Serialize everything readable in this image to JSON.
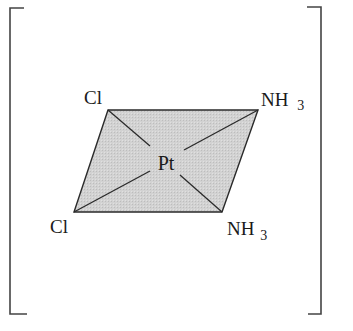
{
  "diagram": {
    "central_atom": "Pt",
    "ligands": [
      {
        "position": "top-left",
        "label": "Cl"
      },
      {
        "position": "top-right",
        "label": "NH",
        "subscript": "3"
      },
      {
        "position": "bottom-left",
        "label": "Cl"
      },
      {
        "position": "bottom-right",
        "label": "NH",
        "subscript": "3"
      }
    ],
    "enclosure": "square-brackets",
    "colors": {
      "plane_fill": "#cfcfcf",
      "line": "#2a2a2a",
      "bracket": "#444444",
      "text": "#1a1a1a"
    }
  }
}
